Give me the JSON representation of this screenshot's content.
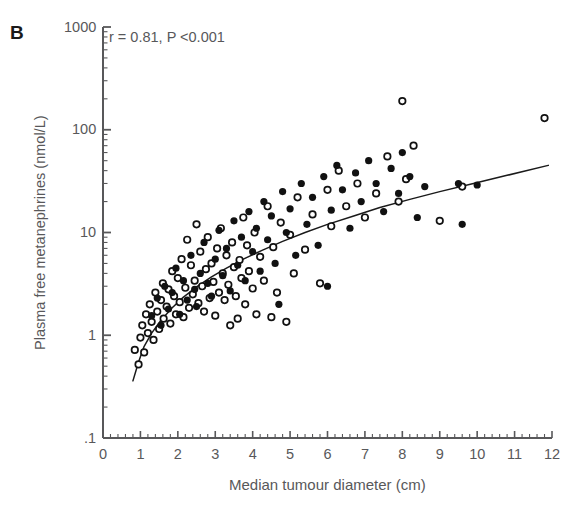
{
  "panel": {
    "label": "B"
  },
  "annotation": {
    "text": "r = 0.81, P <0.001"
  },
  "axes": {
    "xlabel": "Median tumour diameter (cm)",
    "ylabel": "Plasma free metanephrines (nmol/L)",
    "x_tick_labels": [
      "0",
      "1",
      "2",
      "3",
      "4",
      "5",
      "6",
      "7",
      "8",
      "9",
      "10",
      "11",
      "12"
    ],
    "y_tick_labels": [
      ".1",
      "1",
      "10",
      "100",
      "1000"
    ]
  },
  "colors": {
    "axis": "#58585a",
    "text": "#58585a",
    "marker_filled": "#111111",
    "marker_open_stroke": "#111111",
    "curve": "#1a1a1a",
    "background": "#ffffff"
  },
  "chart_data": {
    "type": "scatter",
    "title": "",
    "xlabel": "Median tumour diameter (cm)",
    "ylabel": "Plasma free metanephrines (nmol/L)",
    "xlim": [
      0,
      12
    ],
    "ylim": [
      0.1,
      1000
    ],
    "yscale": "log",
    "xscale": "linear",
    "grid": false,
    "legend_position": "none",
    "annotations": [
      {
        "text": "r = 0.81, P <0.001",
        "x": 0.25,
        "y": 520
      },
      {
        "text": "B",
        "x": -0.6,
        "y": 900
      }
    ],
    "x_ticks": [
      0,
      1,
      2,
      3,
      4,
      5,
      6,
      7,
      8,
      9,
      10,
      11,
      12
    ],
    "y_ticks": [
      0.1,
      1,
      10,
      100,
      1000
    ],
    "x_minor_tick_step": 0.2,
    "series": [
      {
        "name": "open circles",
        "marker": "open-circle",
        "points": [
          [
            0.85,
            0.72
          ],
          [
            0.95,
            0.52
          ],
          [
            1.0,
            0.95
          ],
          [
            1.05,
            1.25
          ],
          [
            1.1,
            0.68
          ],
          [
            1.15,
            1.6
          ],
          [
            1.2,
            1.05
          ],
          [
            1.25,
            2.0
          ],
          [
            1.3,
            1.35
          ],
          [
            1.35,
            0.9
          ],
          [
            1.4,
            2.6
          ],
          [
            1.45,
            1.7
          ],
          [
            1.5,
            1.15
          ],
          [
            1.55,
            2.2
          ],
          [
            1.6,
            3.2
          ],
          [
            1.62,
            1.45
          ],
          [
            1.7,
            1.9
          ],
          [
            1.75,
            2.8
          ],
          [
            1.8,
            1.3
          ],
          [
            1.85,
            4.2
          ],
          [
            1.9,
            2.4
          ],
          [
            1.95,
            1.6
          ],
          [
            2.0,
            3.6
          ],
          [
            2.05,
            2.1
          ],
          [
            2.1,
            5.5
          ],
          [
            2.15,
            1.5
          ],
          [
            2.2,
            2.9
          ],
          [
            2.25,
            8.5
          ],
          [
            2.3,
            1.85
          ],
          [
            2.35,
            4.8
          ],
          [
            2.4,
            2.5
          ],
          [
            2.45,
            3.4
          ],
          [
            2.5,
            12.0
          ],
          [
            2.55,
            2.05
          ],
          [
            2.6,
            6.5
          ],
          [
            2.65,
            3.0
          ],
          [
            2.7,
            1.7
          ],
          [
            2.75,
            4.4
          ],
          [
            2.8,
            9.0
          ],
          [
            2.85,
            2.3
          ],
          [
            2.9,
            5.0
          ],
          [
            2.95,
            3.3
          ],
          [
            3.0,
            1.55
          ],
          [
            3.05,
            7.0
          ],
          [
            3.1,
            2.6
          ],
          [
            3.15,
            11.0
          ],
          [
            3.2,
            4.0
          ],
          [
            3.25,
            2.2
          ],
          [
            3.3,
            6.0
          ],
          [
            3.35,
            3.1
          ],
          [
            3.4,
            1.25
          ],
          [
            3.45,
            8.0
          ],
          [
            3.5,
            4.6
          ],
          [
            3.55,
            2.4
          ],
          [
            3.6,
            1.45
          ],
          [
            3.65,
            5.4
          ],
          [
            3.7,
            3.6
          ],
          [
            3.75,
            14.0
          ],
          [
            3.8,
            2.0
          ],
          [
            3.85,
            7.5
          ],
          [
            3.9,
            4.2
          ],
          [
            4.0,
            2.85
          ],
          [
            4.05,
            10.0
          ],
          [
            4.1,
            1.6
          ],
          [
            4.2,
            5.8
          ],
          [
            4.3,
            3.4
          ],
          [
            4.4,
            18.0
          ],
          [
            4.5,
            1.5
          ],
          [
            4.55,
            7.2
          ],
          [
            4.65,
            2.6
          ],
          [
            4.75,
            12.5
          ],
          [
            4.9,
            1.35
          ],
          [
            5.0,
            9.5
          ],
          [
            5.1,
            4.0
          ],
          [
            5.2,
            22.0
          ],
          [
            5.4,
            6.8
          ],
          [
            5.6,
            15.0
          ],
          [
            5.8,
            3.2
          ],
          [
            6.0,
            26.0
          ],
          [
            6.1,
            11.5
          ],
          [
            6.3,
            40.0
          ],
          [
            6.5,
            18.0
          ],
          [
            6.8,
            30.0
          ],
          [
            7.0,
            14.0
          ],
          [
            7.3,
            24.0
          ],
          [
            7.6,
            55.0
          ],
          [
            7.9,
            20.0
          ],
          [
            8.0,
            190.0
          ],
          [
            8.1,
            33.0
          ],
          [
            8.3,
            70.0
          ],
          [
            9.0,
            13.0
          ],
          [
            9.6,
            28.0
          ],
          [
            11.8,
            130.0
          ]
        ]
      },
      {
        "name": "filled circles",
        "marker": "filled-circle",
        "points": [
          [
            1.3,
            1.55
          ],
          [
            1.45,
            2.3
          ],
          [
            1.55,
            1.25
          ],
          [
            1.65,
            3.0
          ],
          [
            1.75,
            1.8
          ],
          [
            1.85,
            2.6
          ],
          [
            1.95,
            4.5
          ],
          [
            2.05,
            1.6
          ],
          [
            2.15,
            3.4
          ],
          [
            2.25,
            2.2
          ],
          [
            2.35,
            6.0
          ],
          [
            2.45,
            2.8
          ],
          [
            2.5,
            1.9
          ],
          [
            2.6,
            4.0
          ],
          [
            2.7,
            8.0
          ],
          [
            2.8,
            3.2
          ],
          [
            2.9,
            2.4
          ],
          [
            3.0,
            5.5
          ],
          [
            3.1,
            10.5
          ],
          [
            3.2,
            3.8
          ],
          [
            3.3,
            7.0
          ],
          [
            3.4,
            2.7
          ],
          [
            3.5,
            13.0
          ],
          [
            3.6,
            4.8
          ],
          [
            3.7,
            9.0
          ],
          [
            3.8,
            3.4
          ],
          [
            3.9,
            16.0
          ],
          [
            4.0,
            6.5
          ],
          [
            4.1,
            11.0
          ],
          [
            4.2,
            4.2
          ],
          [
            4.3,
            20.0
          ],
          [
            4.4,
            8.5
          ],
          [
            4.5,
            14.5
          ],
          [
            4.6,
            5.0
          ],
          [
            4.7,
            2.0
          ],
          [
            4.8,
            25.0
          ],
          [
            4.9,
            10.0
          ],
          [
            5.0,
            17.0
          ],
          [
            5.15,
            6.0
          ],
          [
            5.3,
            30.0
          ],
          [
            5.45,
            12.0
          ],
          [
            5.6,
            22.0
          ],
          [
            5.75,
            7.5
          ],
          [
            5.9,
            35.0
          ],
          [
            6.0,
            3.0
          ],
          [
            6.1,
            16.5
          ],
          [
            6.25,
            45.0
          ],
          [
            6.4,
            26.0
          ],
          [
            6.6,
            11.0
          ],
          [
            6.75,
            38.0
          ],
          [
            6.9,
            20.0
          ],
          [
            7.1,
            50.0
          ],
          [
            7.3,
            30.0
          ],
          [
            7.5,
            16.0
          ],
          [
            7.7,
            42.0
          ],
          [
            7.9,
            24.0
          ],
          [
            8.0,
            60.0
          ],
          [
            8.2,
            35.0
          ],
          [
            8.4,
            14.0
          ],
          [
            8.6,
            28.0
          ],
          [
            9.5,
            30.0
          ],
          [
            9.6,
            12.0
          ],
          [
            10.0,
            29.0
          ]
        ]
      }
    ],
    "fit_curve": {
      "name": "regression curve",
      "points": [
        [
          0.8,
          0.36
        ],
        [
          0.95,
          0.55
        ],
        [
          1.1,
          0.78
        ],
        [
          1.3,
          1.05
        ],
        [
          1.55,
          1.4
        ],
        [
          1.85,
          1.85
        ],
        [
          2.15,
          2.35
        ],
        [
          2.5,
          2.95
        ],
        [
          2.9,
          3.7
        ],
        [
          3.3,
          4.5
        ],
        [
          3.75,
          5.5
        ],
        [
          4.25,
          6.7
        ],
        [
          4.8,
          8.2
        ],
        [
          5.4,
          10.0
        ],
        [
          6.0,
          12.0
        ],
        [
          6.7,
          14.5
        ],
        [
          7.4,
          17.5
        ],
        [
          8.2,
          21.0
        ],
        [
          9.0,
          25.0
        ],
        [
          9.9,
          30.0
        ],
        [
          10.8,
          36.0
        ],
        [
          11.9,
          45.0
        ]
      ]
    }
  }
}
